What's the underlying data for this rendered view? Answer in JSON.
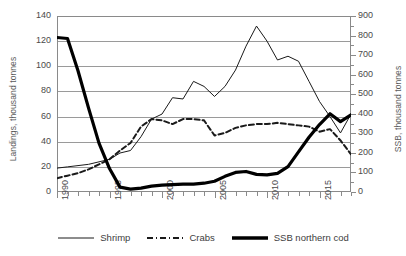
{
  "chart_data": {
    "type": "line",
    "title": "",
    "xlabel": "",
    "ylabel": "Landings, thousand tonnes",
    "y2label": "SSB, thousand tonnes",
    "xlim": [
      1990,
      2018
    ],
    "ylim": [
      0,
      140
    ],
    "y2lim": [
      0,
      900
    ],
    "grid": true,
    "legend_position": "bottom",
    "x": [
      1990,
      1991,
      1992,
      1993,
      1994,
      1995,
      1996,
      1997,
      1998,
      1999,
      2000,
      2001,
      2002,
      2003,
      2004,
      2005,
      2006,
      2007,
      2008,
      2009,
      2010,
      2011,
      2012,
      2013,
      2014,
      2015,
      2016,
      2017,
      2018
    ],
    "y_ticks": [
      0,
      20,
      40,
      60,
      80,
      100,
      120,
      140
    ],
    "y2_ticks": [
      0,
      100,
      200,
      300,
      400,
      500,
      600,
      700,
      800,
      900
    ],
    "x_tick_labels": [
      "1990",
      "1995",
      "2000",
      "2005",
      "2010",
      "2015"
    ],
    "x_tick_label_years": [
      1990,
      1995,
      2000,
      2005,
      2010,
      2015
    ],
    "series": [
      {
        "name": "Shrimp",
        "axis": "left",
        "style": "solid-thin",
        "color": "#1a1a1a",
        "values": [
          19,
          20,
          21,
          22,
          24,
          26,
          31,
          33,
          44,
          58,
          62,
          75,
          74,
          88,
          84,
          76,
          84,
          97,
          116,
          132,
          120,
          105,
          108,
          104,
          88,
          72,
          60,
          47,
          62
        ]
      },
      {
        "name": "Crabs",
        "axis": "left",
        "style": "dashed",
        "color": "#1a1a1a",
        "values": [
          11,
          13,
          15,
          18,
          22,
          26,
          33,
          39,
          52,
          58,
          57,
          54,
          58,
          58,
          57,
          45,
          47,
          51,
          53,
          54,
          54,
          55,
          54,
          53,
          52,
          48,
          50,
          41,
          30
        ]
      },
      {
        "name": "SSB northern cod",
        "axis": "right",
        "style": "solid-thick",
        "color": "#000000",
        "values": [
          790,
          785,
          620,
          430,
          250,
          120,
          25,
          15,
          20,
          30,
          35,
          38,
          40,
          40,
          45,
          55,
          80,
          100,
          105,
          90,
          88,
          95,
          130,
          205,
          280,
          345,
          400,
          360,
          395
        ]
      }
    ]
  },
  "axes": {
    "left_title": "Landings, thousand tonnes",
    "right_title": "SSB, thousand tonnes"
  },
  "legend": {
    "items": [
      {
        "label": "Shrimp",
        "icon": "solid-thin-line-icon"
      },
      {
        "label": "Crabs",
        "icon": "dashed-line-icon"
      },
      {
        "label": "SSB northern cod",
        "icon": "solid-thick-line-icon"
      }
    ]
  }
}
